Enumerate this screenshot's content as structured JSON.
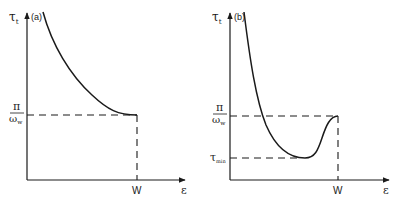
{
  "figure": {
    "panels": [
      {
        "id": "a",
        "panel_label": "(a)",
        "y_axis_label": "τ",
        "y_axis_subscript": "t",
        "x_axis_label": "ε",
        "x_tick_label": "W",
        "level_label_numerator": "π",
        "level_label_denominator": "ω",
        "level_label_den_subscript": "w",
        "description": "Monotonically decreasing curve that flattens out at π/ω_w when ε reaches W"
      },
      {
        "id": "b",
        "panel_label": "(b)",
        "y_axis_label": "τ",
        "y_axis_subscript": "t",
        "x_axis_label": "ε",
        "x_tick_label": "W",
        "level_label_numerator": "π",
        "level_label_denominator": "ω",
        "level_label_den_subscript": "w",
        "min_label": "τ",
        "min_label_subscript": "min",
        "description": "Curve decreases below π/ω_w to a minimum τ_min, then rises back to π/ω_w at ε = W"
      }
    ],
    "colors": {
      "ink": "#1a1a1a",
      "background": "#ffffff"
    }
  }
}
